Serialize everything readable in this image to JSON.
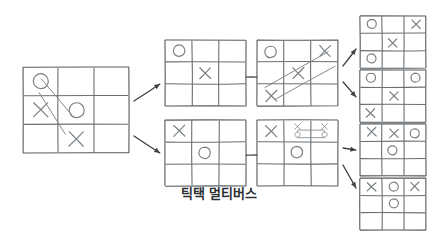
{
  "figure": {
    "caption": "틱택 멀티버스",
    "caption_x": 219,
    "caption_y": 196,
    "caption_font_size": 13,
    "background_color": "#ffffff",
    "stroke_color": "#6a6f73",
    "arrow_color": "#3c4043",
    "mark_color": "#7b8084"
  },
  "diagram": {
    "type": "branching-tree",
    "style": "hand-drawn sketch",
    "levels": 4,
    "board_count": 9,
    "arrow_count": 6,
    "link_count": 2
  },
  "boards": [
    {
      "id": "board-root",
      "name": "root-board",
      "level": 0,
      "x": 23,
      "y": 67,
      "w": 106,
      "h": 86,
      "cells": [
        [
          "O",
          "",
          ""
        ],
        [
          "X",
          "O",
          ""
        ],
        [
          "",
          "X",
          ""
        ]
      ],
      "has_scribble": true,
      "scribble": "diagonal slash lines crossing the grid"
    },
    {
      "id": "board-top-1",
      "name": "top-branch-board-1",
      "level": 1,
      "x": 165,
      "y": 40,
      "w": 81,
      "h": 66,
      "cells": [
        [
          "O",
          "",
          ""
        ],
        [
          "",
          "X",
          ""
        ],
        [
          "",
          "",
          ""
        ]
      ],
      "has_scribble": false
    },
    {
      "id": "board-top-2",
      "name": "top-branch-board-2",
      "level": 2,
      "x": 257,
      "y": 40,
      "w": 81,
      "h": 66,
      "cells": [
        [
          "O",
          "",
          "X"
        ],
        [
          "",
          "X",
          ""
        ],
        [
          "X",
          "",
          ""
        ]
      ],
      "has_scribble": true,
      "scribble": "two long diagonal arrows crossing the board toward upper right"
    },
    {
      "id": "board-top-out-a",
      "name": "top-outcome-board-a",
      "level": 3,
      "x": 360,
      "y": 16,
      "w": 66,
      "h": 52,
      "cells": [
        [
          "O",
          "",
          "X"
        ],
        [
          "",
          "X",
          ""
        ],
        [
          "O",
          "",
          ""
        ]
      ],
      "has_scribble": false
    },
    {
      "id": "board-top-out-b",
      "name": "top-outcome-board-b",
      "level": 3,
      "x": 360,
      "y": 70,
      "w": 66,
      "h": 52,
      "cells": [
        [
          "O",
          "",
          "O"
        ],
        [
          "",
          "X",
          ""
        ],
        [
          "X",
          "",
          ""
        ]
      ],
      "has_scribble": false
    },
    {
      "id": "board-bottom-1",
      "name": "bottom-branch-board-1",
      "level": 1,
      "x": 165,
      "y": 120,
      "w": 81,
      "h": 66,
      "cells": [
        [
          "X",
          "",
          ""
        ],
        [
          "",
          "O",
          ""
        ],
        [
          "",
          "",
          ""
        ]
      ],
      "has_scribble": false
    },
    {
      "id": "board-bottom-2",
      "name": "bottom-branch-board-2",
      "level": 2,
      "x": 257,
      "y": 120,
      "w": 81,
      "h": 66,
      "cells": [
        [
          "X",
          "",
          ""
        ],
        [
          "",
          "O",
          ""
        ],
        [
          "",
          "",
          ""
        ]
      ],
      "has_scribble": true,
      "scribble": "small x-over-o pairs joined by bracket lines in the top middle and top right cells"
    },
    {
      "id": "board-bottom-out-a",
      "name": "bottom-outcome-board-a",
      "level": 3,
      "x": 360,
      "y": 124,
      "w": 66,
      "h": 52,
      "cells": [
        [
          "X",
          "X",
          "O"
        ],
        [
          "",
          "O",
          ""
        ],
        [
          "",
          "",
          ""
        ]
      ],
      "has_scribble": false
    },
    {
      "id": "board-bottom-out-b",
      "name": "bottom-outcome-board-b",
      "level": 3,
      "x": 360,
      "y": 178,
      "w": 66,
      "h": 52,
      "cells": [
        [
          "X",
          "O",
          "X"
        ],
        [
          "",
          "O",
          ""
        ],
        [
          "",
          "",
          ""
        ]
      ],
      "has_scribble": false
    }
  ],
  "arrows": [
    {
      "id": "arrow-root-to-top",
      "name": "arrow-root-to-top-branch",
      "x1": 134,
      "y1": 101,
      "x2": 160,
      "y2": 84
    },
    {
      "id": "arrow-root-to-bottom",
      "name": "arrow-root-to-bottom-branch",
      "x1": 134,
      "y1": 136,
      "x2": 160,
      "y2": 153
    },
    {
      "id": "arrow-top2-to-outa",
      "name": "arrow-top-board-to-outcome-a",
      "x1": 343,
      "y1": 66,
      "x2": 356,
      "y2": 49
    },
    {
      "id": "arrow-top2-to-outb",
      "name": "arrow-top-board-to-outcome-b",
      "x1": 343,
      "y1": 82,
      "x2": 356,
      "y2": 97
    },
    {
      "id": "arrow-bot2-to-outa",
      "name": "arrow-bottom-board-to-outcome-a",
      "x1": 343,
      "y1": 148,
      "x2": 356,
      "y2": 150
    },
    {
      "id": "arrow-bot2-to-outb",
      "name": "arrow-bottom-board-to-outcome-b",
      "x1": 343,
      "y1": 165,
      "x2": 356,
      "y2": 188
    }
  ],
  "links": [
    {
      "id": "link-top",
      "name": "link-top-boards",
      "x1": 246,
      "y1": 77,
      "x2": 257,
      "y2": 77
    },
    {
      "id": "link-bottom",
      "name": "link-bottom-boards",
      "x1": 246,
      "y1": 155,
      "x2": 257,
      "y2": 155
    }
  ]
}
